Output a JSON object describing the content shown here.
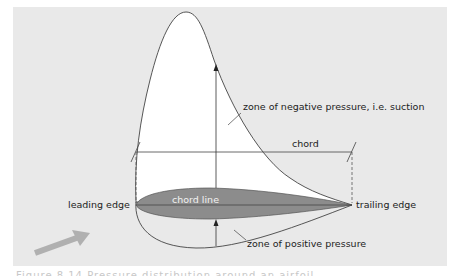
{
  "diagram": {
    "title": "Pressure distribution around an airfoil",
    "labels": {
      "negative_pressure": "zone of negative pressure, i.e. suction",
      "chord": "chord",
      "chord_line": "chord line",
      "leading_edge": "leading edge",
      "trailing_edge": "trailing edge",
      "positive_pressure": "zone of positive pressure"
    },
    "caption": "Figure 8.14 Pressure distribution around an airfoil",
    "colors": {
      "panel_bg": "#e9e9e9",
      "suction_zone": "#ffffff",
      "airfoil": "#8c8c8c",
      "arrow": "#b0b0b0",
      "line": "#333333"
    }
  }
}
